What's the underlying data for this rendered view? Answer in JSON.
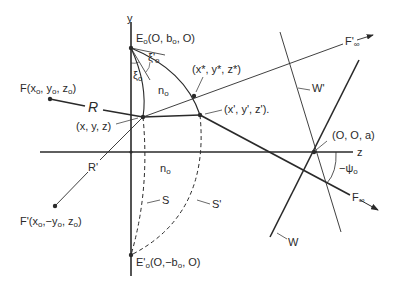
{
  "diagram": {
    "axes": {
      "y_label": "y",
      "z_label": "z"
    },
    "points": {
      "E0": {
        "name": "E",
        "sub": "o",
        "coords": "(O, b",
        "coords_sub": "o",
        "coords_tail": ", O)"
      },
      "E0_prime": {
        "name": "E'",
        "sub": "o",
        "coords": "(O,−b",
        "coords_sub": "o",
        "coords_tail": ", O)"
      },
      "F": {
        "name": "F(x",
        "s1": "o",
        "m1": ", y",
        "s2": "o",
        "m2": ", z",
        "s3": "o",
        "tail": ")"
      },
      "F_prime": {
        "name": "F'(x",
        "s1": "o",
        "m1": ",−y",
        "s2": "o",
        "m2": ", z",
        "s3": "o",
        "tail": ")"
      },
      "xyz": "(x, y, z)",
      "xyz_prime": "(x', y', z').",
      "xyz_star": "(x*, y*, z*)",
      "origin_a": "(O, O, a)"
    },
    "rays": {
      "R": "R",
      "R_prime": "R'",
      "F_inf": "F",
      "F_inf_sub": "∞",
      "F_inf_prime": "F'",
      "F_inf_prime_sub": "∞"
    },
    "angles": {
      "xi0": "ξ",
      "xi0_sub": "o",
      "xi0_prime": "ξ'",
      "xi0_prime_sub": "o",
      "psi0": "−ψ",
      "psi0_sub": "o"
    },
    "regions": {
      "n0_upper": "n",
      "n0_upper_sub": "o",
      "n0_lower": "n",
      "n0_lower_sub": "o"
    },
    "surfaces": {
      "S": "S",
      "S_prime": "S'",
      "W": "W",
      "W_prime": "W'"
    },
    "colors": {
      "ink": "#2a2a2a",
      "background": "#ffffff"
    }
  }
}
